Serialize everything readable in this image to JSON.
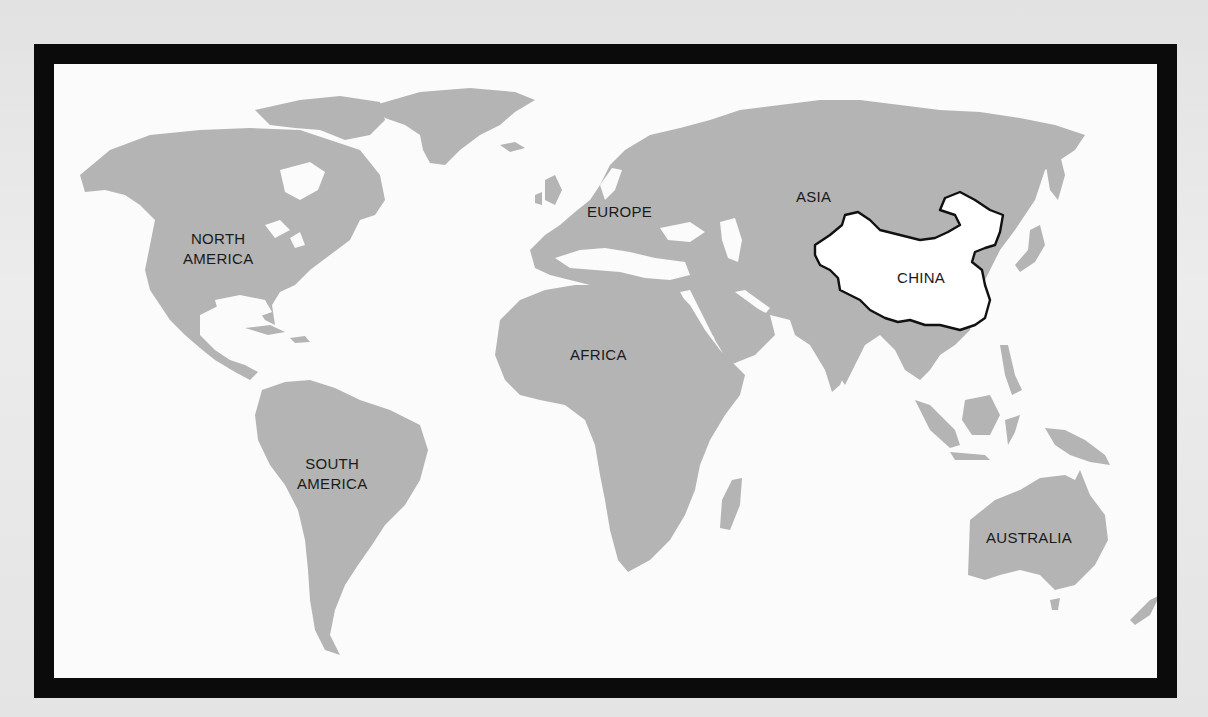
{
  "map": {
    "type": "world outline map",
    "colors": {
      "land": "#b4b4b4",
      "ocean": "#fbfbfb",
      "highlight_fill": "#ffffff",
      "highlight_outline": "#111111",
      "frame": "#0b0b0b",
      "background": "#e6e6e6"
    },
    "highlighted_country": "China",
    "labels": {
      "north_america": {
        "line1": "NORTH",
        "line2": "AMERICA"
      },
      "south_america": {
        "line1": "SOUTH",
        "line2": "AMERICA"
      },
      "europe": "EUROPE",
      "asia": "ASIA",
      "africa": "AFRICA",
      "china": "CHINA",
      "australia": "AUSTRALIA"
    }
  }
}
